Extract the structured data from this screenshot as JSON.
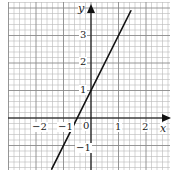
{
  "chart_data": {
    "type": "line",
    "title": "",
    "xlabel": "x",
    "ylabel": "y",
    "xlim": [
      -3.0,
      2.9
    ],
    "ylim": [
      -1.9,
      4.3
    ],
    "grid": true,
    "grid_minor_step": 0.2,
    "grid_major_step": 1,
    "x_ticks": [
      "-2",
      "-1",
      "0",
      "1",
      "2"
    ],
    "y_ticks": [
      "3",
      "2",
      "1",
      "-1"
    ],
    "series": [
      {
        "name": "y = 2x + 1",
        "x": [
          -1.43,
          1.45
        ],
        "y": [
          -1.86,
          3.9
        ]
      }
    ]
  },
  "labels": {
    "x_axis": "x",
    "y_axis": "y",
    "origin": "0",
    "xt_m2": "−2",
    "xt_m1": "−1",
    "xt_1": "1",
    "xt_2": "2",
    "yt_3": "3",
    "yt_2": "2",
    "yt_1": "1",
    "yt_m1": "−1"
  }
}
